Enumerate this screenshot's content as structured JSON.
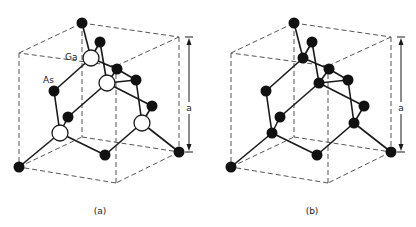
{
  "figures": [
    {
      "id": "a",
      "caption": "(a)",
      "offset_x": 0,
      "dimension_label": "a",
      "atom_labels": [
        {
          "text": "Ga",
          "x": 65,
          "y": 53
        },
        {
          "text": "As",
          "x": 43,
          "y": 76
        }
      ],
      "large_atoms_white": true
    },
    {
      "id": "b",
      "caption": "(b)",
      "offset_x": 212,
      "dimension_label": "a",
      "atom_labels": [],
      "large_atoms_white": false
    }
  ],
  "structure": {
    "cube_solid_edges": [],
    "cube_dashed_edges": [
      [
        19,
        53,
        82,
        23
      ],
      [
        82,
        23,
        179,
        37
      ],
      [
        179,
        37,
        116,
        66
      ],
      [
        116,
        66,
        19,
        53
      ],
      [
        19,
        167,
        82,
        137
      ],
      [
        82,
        137,
        179,
        152
      ],
      [
        179,
        152,
        116,
        183
      ],
      [
        116,
        183,
        19,
        167
      ],
      [
        19,
        53,
        19,
        167
      ],
      [
        82,
        23,
        82,
        137
      ],
      [
        179,
        37,
        179,
        152
      ],
      [
        116,
        66,
        116,
        183
      ]
    ],
    "bonds": [
      [
        82,
        23,
        91,
        58
      ],
      [
        100,
        42,
        91,
        58
      ],
      [
        91,
        58,
        54,
        91
      ],
      [
        91,
        58,
        117,
        69
      ],
      [
        100,
        42,
        107,
        83
      ],
      [
        117,
        69,
        107,
        83
      ],
      [
        136,
        80,
        107,
        83
      ],
      [
        107,
        83,
        68,
        117
      ],
      [
        107,
        83,
        152,
        106
      ],
      [
        117,
        69,
        136,
        80
      ],
      [
        136,
        80,
        142,
        123
      ],
      [
        152,
        106,
        142,
        123
      ],
      [
        142,
        123,
        179,
        152
      ],
      [
        142,
        123,
        105,
        155
      ],
      [
        54,
        91,
        60,
        133
      ],
      [
        68,
        117,
        60,
        133
      ],
      [
        60,
        133,
        19,
        167
      ],
      [
        60,
        133,
        105,
        155
      ]
    ],
    "atoms_small": [
      [
        82,
        23
      ],
      [
        100,
        42
      ],
      [
        117,
        69
      ],
      [
        136,
        80
      ],
      [
        54,
        91
      ],
      [
        152,
        106
      ],
      [
        68,
        117
      ],
      [
        105,
        155
      ],
      [
        179,
        152
      ],
      [
        19,
        167
      ]
    ],
    "atoms_large": [
      [
        91,
        58
      ],
      [
        107,
        83
      ],
      [
        142,
        123
      ],
      [
        60,
        133
      ]
    ],
    "dimension_arrow": {
      "x": 189,
      "y1": 37,
      "y2": 152,
      "label_y": 108
    }
  },
  "colors": {
    "atom_fill": "#111111",
    "line": "#1a1a1a",
    "dash": "#555555",
    "white_atom_fill": "#ffffff"
  }
}
